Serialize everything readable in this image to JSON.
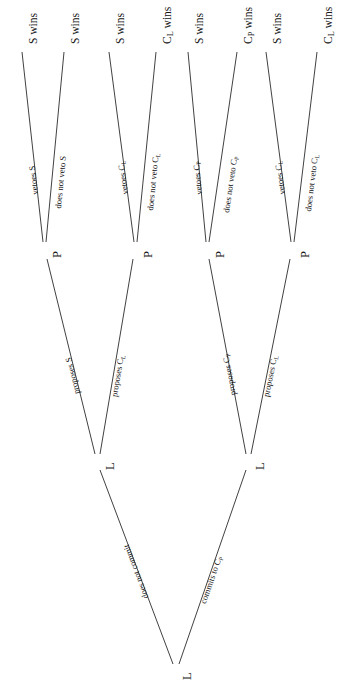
{
  "figure": {
    "type": "game-tree",
    "orientation": "rotated-90-counterclockwise",
    "background": "#ffffff",
    "line_color": "#2b2b2b"
  },
  "nodes": {
    "root": {
      "label": "L",
      "name": "root-node-L"
    },
    "l_left": {
      "label": "L",
      "name": "node-L-left"
    },
    "l_right": {
      "label": "L",
      "name": "node-L-right"
    },
    "p1": {
      "label": "P",
      "name": "node-P-1"
    },
    "p2": {
      "label": "P",
      "name": "node-P-2"
    },
    "p3": {
      "label": "P",
      "name": "node-P-3"
    },
    "p4": {
      "label": "P",
      "name": "node-P-4"
    }
  },
  "edges": {
    "root_left": "does not commit",
    "root_right": "commits to C",
    "root_right_sub": "P",
    "l_left_a": "proposes S",
    "l_left_b": "proposes C",
    "l_left_b_sub": "L",
    "l_right_a": "proposes C",
    "l_right_a_sub": "P",
    "l_right_b": "proposes C",
    "l_right_b_sub": "L",
    "p1_a": "vetoes S",
    "p1_b": "does not veto S",
    "p2_a": "vetoes C",
    "p2_a_sub": "L",
    "p2_b": "does not veto C",
    "p2_b_sub": "L",
    "p3_a": "vetoes C",
    "p3_a_sub": "P",
    "p3_b": "does not veto C",
    "p3_b_sub": "P",
    "p4_a": "vetoes C",
    "p4_a_sub": "L",
    "p4_b": "does not veto C",
    "p4_b_sub": "L"
  },
  "terminals": [
    {
      "text": "S wins",
      "sub": "",
      "name": "terminal-1-S-wins"
    },
    {
      "text": "S wins",
      "sub": "",
      "name": "terminal-2-S-wins"
    },
    {
      "text": "S wins",
      "sub": "",
      "name": "terminal-3-S-wins"
    },
    {
      "text": "C",
      "sub": "L",
      "suffix": " wins",
      "name": "terminal-4-CL-wins"
    },
    {
      "text": "S wins",
      "sub": "",
      "name": "terminal-5-S-wins"
    },
    {
      "text": "C",
      "sub": "P",
      "suffix": " wins",
      "name": "terminal-6-CP-wins"
    },
    {
      "text": "S wins",
      "sub": "",
      "name": "terminal-7-S-wins"
    },
    {
      "text": "C",
      "sub": "L",
      "suffix": " wins",
      "name": "terminal-8-CL-wins"
    }
  ]
}
